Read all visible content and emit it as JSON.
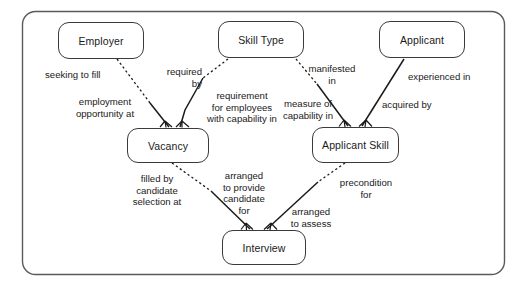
{
  "diagram": {
    "type": "entity-relationship-diagram",
    "colors": {
      "border": "#3a3a3a",
      "line": "#1a1a1a",
      "background": "#ffffff",
      "text": "#1a1a1a"
    },
    "container": {
      "name": "diagram-frame",
      "x": 22,
      "y": 11,
      "width": 483,
      "height": 264
    },
    "entities": [
      {
        "id": "employer",
        "label": "Employer",
        "x": 58,
        "y": 22,
        "width": 86,
        "height": 37
      },
      {
        "id": "skill-type",
        "label": "Skill Type",
        "x": 218,
        "y": 21,
        "width": 86,
        "height": 37
      },
      {
        "id": "applicant",
        "label": "Applicant",
        "x": 379,
        "y": 21,
        "width": 86,
        "height": 37
      },
      {
        "id": "vacancy",
        "label": "Vacancy",
        "x": 127,
        "y": 128,
        "width": 82,
        "height": 35
      },
      {
        "id": "applicant-skill",
        "label": "Applicant Skill",
        "x": 312,
        "y": 127,
        "width": 87,
        "height": 36
      },
      {
        "id": "interview",
        "label": "Interview",
        "x": 222,
        "y": 230,
        "width": 84,
        "height": 35
      }
    ],
    "relationships": [
      {
        "id": "employer-vacancy",
        "from": "Employer",
        "to": "Vacancy",
        "forward_label": "seeking to fill",
        "inverse_label": "employment\nopportunity at",
        "style": "dashed-to-solid"
      },
      {
        "id": "skilltype-vacancy",
        "from": "Skill Type",
        "to": "Vacancy",
        "forward_label": "required\nby",
        "inverse_label": "requirement\nfor employees\nwith capability in",
        "style": "dashed-to-solid"
      },
      {
        "id": "skilltype-applicantskill",
        "from": "Skill Type",
        "to": "Applicant Skill",
        "forward_label": "manifested\nin",
        "inverse_label": "measure of\ncapability in",
        "style": "dashed-to-solid"
      },
      {
        "id": "applicant-applicantskill",
        "from": "Applicant",
        "to": "Applicant Skill",
        "forward_label": "experienced in",
        "inverse_label": "acquired by",
        "style": "solid"
      },
      {
        "id": "vacancy-interview",
        "from": "Vacancy",
        "to": "Interview",
        "forward_label": "filled by\ncandidate\nselection at",
        "inverse_label": "arranged\nto provide\ncandidate\nfor",
        "style": "dashed-to-solid"
      },
      {
        "id": "applicantskill-interview",
        "from": "Applicant Skill",
        "to": "Interview",
        "forward_label": "precondition\nfor",
        "inverse_label": "arranged\nto assess",
        "style": "dashed-to-solid"
      }
    ],
    "labels": [
      {
        "id": "seeking-to-fill",
        "text": "seeking to fill",
        "x": 45,
        "y": 69,
        "width": 80,
        "align": "left"
      },
      {
        "id": "employment-opportunity-at",
        "text": "employment\nopportunity at",
        "x": 60,
        "y": 96,
        "width": 90,
        "align": "center"
      },
      {
        "id": "required-by",
        "text": "required\nby",
        "x": 150,
        "y": 66,
        "width": 52,
        "align": "right"
      },
      {
        "id": "requirement-for-employees",
        "text": "requirement\nfor employees\nwith capability in",
        "x": 196,
        "y": 90,
        "width": 92,
        "align": "center"
      },
      {
        "id": "manifested-in",
        "text": "manifested\nin",
        "x": 303,
        "y": 63,
        "width": 58,
        "align": "center"
      },
      {
        "id": "measure-of-capability-in",
        "text": "measure of\ncapability in",
        "x": 276,
        "y": 98,
        "width": 64,
        "align": "center"
      },
      {
        "id": "experienced-in",
        "text": "experienced in",
        "x": 408,
        "y": 71,
        "width": 76,
        "align": "left"
      },
      {
        "id": "acquired-by",
        "text": "acquired by",
        "x": 382,
        "y": 99,
        "width": 64,
        "align": "left"
      },
      {
        "id": "filled-by-candidate-selection-at",
        "text": "filled by\ncandidate\nselection at",
        "x": 123,
        "y": 173,
        "width": 68,
        "align": "center"
      },
      {
        "id": "arranged-to-provide-candidate-for",
        "text": "arranged\nto provide\ncandidate\nfor",
        "x": 216,
        "y": 170,
        "width": 56,
        "align": "center"
      },
      {
        "id": "arranged-to-assess",
        "text": "arranged\nto assess",
        "x": 282,
        "y": 206,
        "width": 58,
        "align": "center"
      },
      {
        "id": "precondition-for",
        "text": "precondition\nfor",
        "x": 333,
        "y": 177,
        "width": 66,
        "align": "center"
      }
    ]
  }
}
